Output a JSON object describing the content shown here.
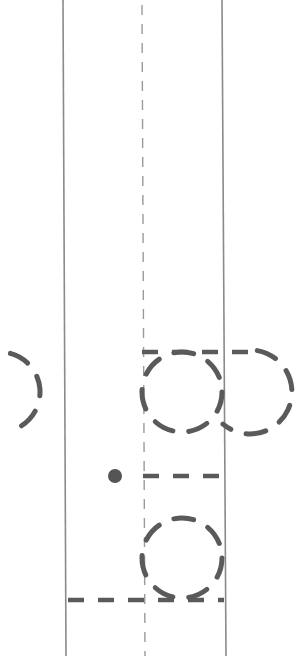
{
  "diagram": {
    "canvas": {
      "width": 308,
      "height": 656,
      "background": "#ffffff"
    },
    "colors": {
      "line": "#8a8a8a",
      "dash": "#5a5a5a",
      "center_line": "#9a9a9a",
      "dot": "#555555"
    },
    "elements": {
      "left_boundary_line": {
        "type": "solid-line",
        "x1": 63,
        "y1": 0,
        "x2": 66,
        "y2": 656
      },
      "right_boundary_line": {
        "type": "solid-line",
        "x1": 222,
        "y1": 0,
        "x2": 226,
        "y2": 656
      },
      "center_line": {
        "type": "thin-dashed-line",
        "x1": 142,
        "y1": 5,
        "x2": 145,
        "y2": 656
      },
      "top_horizontal_dash": {
        "type": "thick-dashed-line",
        "x1": 142,
        "y1": 352,
        "x2": 250,
        "y2": 352
      },
      "upper_circle": {
        "type": "dashed-circle",
        "cx": 182,
        "cy": 392,
        "r": 40
      },
      "upper_right_arc": {
        "type": "dashed-arc",
        "cx": 250,
        "cy": 392,
        "r": 42
      },
      "upper_left_arc": {
        "type": "dashed-arc",
        "cx": 0,
        "cy": 392,
        "r": 40
      },
      "marker_dot": {
        "type": "dot",
        "cx": 115,
        "cy": 476,
        "r": 7
      },
      "middle_horizontal_dash": {
        "type": "thick-dashed-line",
        "x1": 143,
        "y1": 476,
        "x2": 224,
        "y2": 476
      },
      "lower_circle": {
        "type": "dashed-circle",
        "cx": 182,
        "cy": 558,
        "r": 40
      },
      "bottom_horizontal_dash": {
        "type": "thick-dashed-line",
        "x1": 68,
        "y1": 600,
        "x2": 224,
        "y2": 600
      }
    }
  }
}
